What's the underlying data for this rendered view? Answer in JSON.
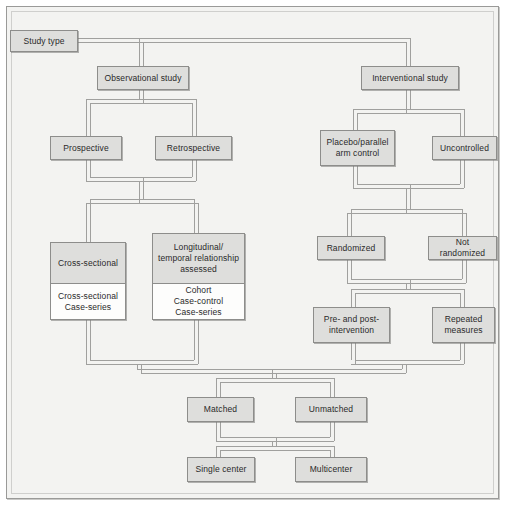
{
  "diagram": {
    "colors": {
      "page_background": "#ffffff",
      "frame_background": "#f3f3f1",
      "frame_border": "#9a9a98",
      "node_fill": "#dededc",
      "node_fill_secondary": "#fdfdfc",
      "node_border": "#8d8d8b",
      "connector": "#a0a09e",
      "text": "#2a2a2a"
    },
    "nodes": [
      {
        "id": "study-type",
        "label": "Study type",
        "x": 10,
        "y": 30,
        "w": 68,
        "h": 22
      },
      {
        "id": "observational",
        "label": "Observational study",
        "x": 97,
        "y": 66,
        "w": 92,
        "h": 24
      },
      {
        "id": "interventional",
        "label": "Interventional study",
        "x": 361,
        "y": 66,
        "w": 98,
        "h": 24
      },
      {
        "id": "prospective",
        "label": "Prospective",
        "x": 50,
        "y": 136,
        "w": 72,
        "h": 24
      },
      {
        "id": "retrospective",
        "label": "Retrospective",
        "x": 155,
        "y": 136,
        "w": 77,
        "h": 24
      },
      {
        "id": "placebo",
        "label": "Placebo/parallel\narm control",
        "x": 320,
        "y": 130,
        "w": 75,
        "h": 36
      },
      {
        "id": "uncontrolled",
        "label": "Uncontrolled",
        "x": 432,
        "y": 136,
        "w": 65,
        "h": 24
      },
      {
        "id": "randomized",
        "label": "Randomized",
        "x": 317,
        "y": 236,
        "w": 68,
        "h": 24
      },
      {
        "id": "not-randomized",
        "label": "Not randomized",
        "x": 428,
        "y": 236,
        "w": 69,
        "h": 24
      },
      {
        "id": "pre-post",
        "label": "Pre- and post-\nintervention",
        "x": 313,
        "y": 307,
        "w": 77,
        "h": 36
      },
      {
        "id": "repeated-measures",
        "label": "Repeated\nmeasures",
        "x": 432,
        "y": 307,
        "w": 63,
        "h": 36
      },
      {
        "id": "matched",
        "label": "Matched",
        "x": 187,
        "y": 397,
        "w": 67,
        "h": 25
      },
      {
        "id": "unmatched",
        "label": "Unmatched",
        "x": 295,
        "y": 397,
        "w": 72,
        "h": 25
      },
      {
        "id": "single-center",
        "label": "Single center",
        "x": 187,
        "y": 457,
        "w": 68,
        "h": 25
      },
      {
        "id": "multicenter",
        "label": "Multicenter",
        "x": 295,
        "y": 457,
        "w": 72,
        "h": 25
      }
    ],
    "split_nodes": [
      {
        "id": "cross-sectional",
        "top_label": "Cross-sectional",
        "bottom_label": "Cross-sectional\nCase-series",
        "x": 50,
        "y": 242,
        "w": 76,
        "h": 78,
        "split_at": 41
      },
      {
        "id": "longitudinal",
        "top_label": "Longitudinal/\ntemporal relationship\nassessed",
        "bottom_label": "Cohort\nCase-control\nCase-series",
        "x": 152,
        "y": 233,
        "w": 93,
        "h": 87,
        "split_at": 50
      }
    ],
    "edges": [
      {
        "from": "study-type",
        "to": "observational",
        "kind": "bus-top-left"
      },
      {
        "from": "study-type",
        "to": "interventional",
        "kind": "bus-top-right"
      },
      {
        "from": "observational",
        "to": "prospective",
        "kind": "fork"
      },
      {
        "from": "observational",
        "to": "retrospective",
        "kind": "fork"
      },
      {
        "from": "prospective",
        "to": "cross-sectional",
        "kind": "merge-fork"
      },
      {
        "from": "retrospective",
        "to": "longitudinal",
        "kind": "merge-fork"
      },
      {
        "from": "interventional",
        "to": "placebo",
        "kind": "fork"
      },
      {
        "from": "interventional",
        "to": "uncontrolled",
        "kind": "fork"
      },
      {
        "from": "placebo",
        "to": "randomized",
        "kind": "merge-fork"
      },
      {
        "from": "uncontrolled",
        "to": "not-randomized",
        "kind": "merge-fork"
      },
      {
        "from": "randomized",
        "to": "pre-post",
        "kind": "merge-fork"
      },
      {
        "from": "not-randomized",
        "to": "repeated-measures",
        "kind": "merge-fork"
      },
      {
        "from": "cross-sectional",
        "to": "matched",
        "kind": "grand-merge"
      },
      {
        "from": "longitudinal",
        "to": "unmatched",
        "kind": "grand-merge"
      },
      {
        "from": "pre-post",
        "to": "matched",
        "kind": "grand-merge"
      },
      {
        "from": "repeated-measures",
        "to": "unmatched",
        "kind": "grand-merge"
      },
      {
        "from": "matched",
        "to": "single-center",
        "kind": "merge-fork"
      },
      {
        "from": "unmatched",
        "to": "multicenter",
        "kind": "merge-fork"
      }
    ]
  }
}
